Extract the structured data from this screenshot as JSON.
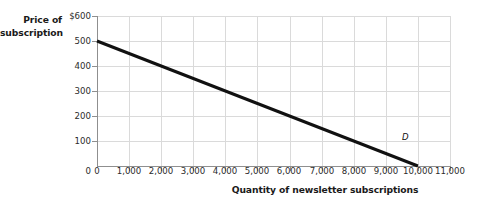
{
  "chart_data": {
    "type": "line",
    "title": "",
    "xlabel": "Quantity of newsletter subscriptions",
    "ylabel_line1": "Price of",
    "ylabel_line2": "subscription",
    "xlim": [
      0,
      11000
    ],
    "ylim": [
      0,
      600
    ],
    "grid": true,
    "legend_position": "inline-annotation",
    "xticks": [
      0,
      1000,
      2000,
      3000,
      4000,
      5000,
      6000,
      7000,
      8000,
      9000,
      10000,
      11000
    ],
    "xtick_labels": [
      "0",
      "1,000",
      "2,000",
      "3,000",
      "4,000",
      "5,000",
      "6,000",
      "7,000",
      "8,000",
      "9,000",
      "10,000",
      "11,000"
    ],
    "yticks": [
      0,
      100,
      200,
      300,
      400,
      500,
      600
    ],
    "ytick_labels": [
      "0",
      "100",
      "200",
      "300",
      "400",
      "500",
      "$600"
    ],
    "series": [
      {
        "name": "D",
        "annotation": "D",
        "annotation_x": 9600,
        "annotation_y": 90,
        "color": "#111111",
        "line_width": 3,
        "x": [
          0,
          10000
        ],
        "values": [
          500,
          0
        ],
        "points": [
          {
            "x": 0,
            "y": 500
          },
          {
            "x": 1000,
            "y": 450
          },
          {
            "x": 2000,
            "y": 400
          },
          {
            "x": 3000,
            "y": 350
          },
          {
            "x": 4000,
            "y": 300
          },
          {
            "x": 5000,
            "y": 250
          },
          {
            "x": 6000,
            "y": 200
          },
          {
            "x": 7000,
            "y": 150
          },
          {
            "x": 8000,
            "y": 100
          },
          {
            "x": 9000,
            "y": 50
          },
          {
            "x": 10000,
            "y": 0
          }
        ]
      }
    ],
    "colors": {
      "background": "#ffffff",
      "grid": "#d9d9d9",
      "axis": "#8c8c8c",
      "curve": "#111111",
      "text": "#1a1a1a"
    }
  }
}
